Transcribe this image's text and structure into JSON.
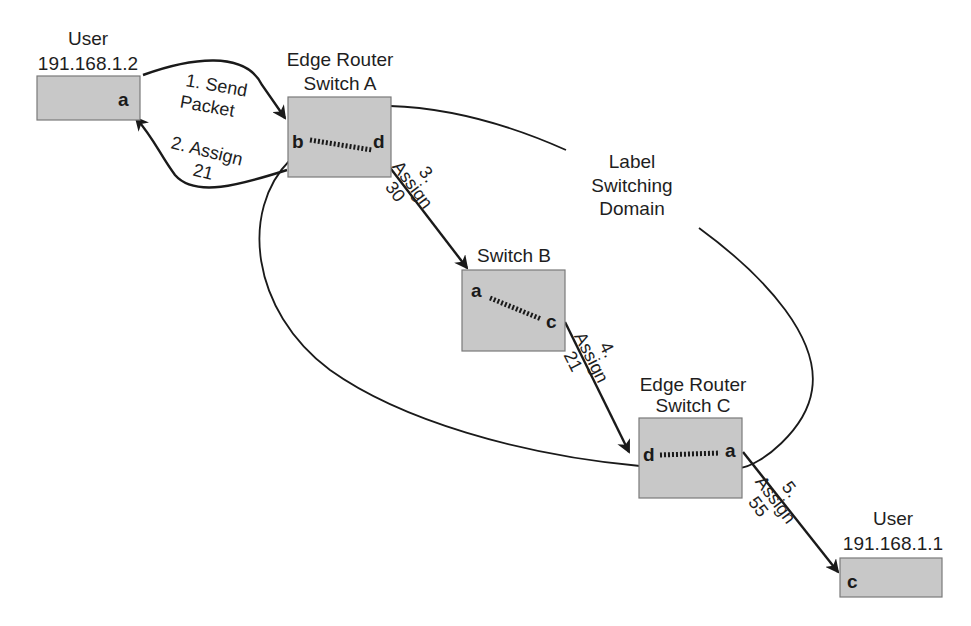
{
  "diagram": {
    "title": "Label Switching Domain",
    "domain_label": [
      "Label",
      "Switching",
      "Domain"
    ],
    "colors": {
      "box_fill": "#c8c8c8",
      "box_stroke": "#7a7a7a",
      "line": "#1a1a1a",
      "background": "#ffffff"
    },
    "nodes": {
      "user_src": {
        "title": "User",
        "address": "191.168.1.2",
        "ports": [
          "a"
        ]
      },
      "switch_a": {
        "title_line1": "Edge Router",
        "title_line2": "Switch A",
        "ports": [
          "b",
          "d"
        ]
      },
      "switch_b": {
        "title": "Switch B",
        "ports": [
          "a",
          "c"
        ]
      },
      "switch_c": {
        "title_line1": "Edge Router",
        "title_line2": "Switch C",
        "ports": [
          "d",
          "a"
        ]
      },
      "user_dst": {
        "title": "User",
        "address": "191.168.1.1",
        "ports": [
          "c"
        ]
      }
    },
    "steps": [
      {
        "line1": "1. Send",
        "line2": "Packet"
      },
      {
        "line1": "2. Assign",
        "line2": "21"
      },
      {
        "line1": "3.",
        "line2": "Assign",
        "line3": "30"
      },
      {
        "line1": "4.",
        "line2": "Assign",
        "line3": "21"
      },
      {
        "line1": "5.",
        "line2": "Assign",
        "line3": "55"
      }
    ]
  }
}
